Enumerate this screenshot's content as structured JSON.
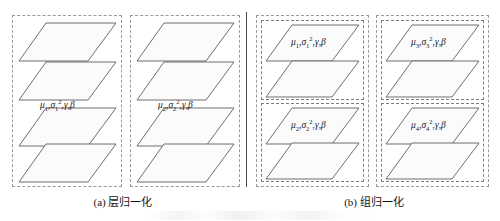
{
  "figure": {
    "background": "#ffffff",
    "stroke_color": "#5f5f5f",
    "dash_color": "#8a8a8a",
    "face_color": "#fbfbfb",
    "divider_color": "#4a4a4a"
  },
  "panels": [
    {
      "id": "a",
      "caption": "(a) 层归一化",
      "groups": [
        {
          "id": "a-group-1",
          "label_mu": "μ",
          "label_mu_sub": "1",
          "label_sigma": "σ",
          "label_sigma_sub": "1",
          "label_sigma_sup": "2",
          "label_gamma": "γ",
          "label_beta": "β",
          "label_full": "μ₁,σ₁²,γ,β",
          "plane_count": 4
        },
        {
          "id": "a-group-2",
          "label_mu": "μ",
          "label_mu_sub": "2",
          "label_sigma": "σ",
          "label_sigma_sub": "2",
          "label_sigma_sup": "2",
          "label_gamma": "γ",
          "label_beta": "β",
          "label_full": "μ₂,σ₂²,γ,β",
          "plane_count": 4
        }
      ]
    },
    {
      "id": "b",
      "caption": "(b) 组归一化",
      "groups": [
        {
          "id": "b-group-1",
          "label_mu": "μ",
          "label_mu_sub": "1",
          "label_sigma": "σ",
          "label_sigma_sub": "1",
          "label_sigma_sup": "2",
          "label_gamma": "γ",
          "label_beta": "β",
          "label_full": "μ₁,σ₁²,γ,β",
          "plane_count": 2
        },
        {
          "id": "b-group-2",
          "label_mu": "μ",
          "label_mu_sub": "2",
          "label_sigma": "σ",
          "label_sigma_sub": "2",
          "label_sigma_sup": "2",
          "label_gamma": "γ",
          "label_beta": "β",
          "label_full": "μ₂,σ₂²,γ,β",
          "plane_count": 2
        },
        {
          "id": "b-group-3",
          "label_mu": "μ",
          "label_mu_sub": "3",
          "label_sigma": "σ",
          "label_sigma_sub": "3",
          "label_sigma_sup": "2",
          "label_gamma": "γ",
          "label_beta": "β",
          "label_full": "μ₃,σ₃²,γ,β",
          "plane_count": 2
        },
        {
          "id": "b-group-4",
          "label_mu": "μ",
          "label_mu_sub": "4",
          "label_sigma": "σ",
          "label_sigma_sub": "4",
          "label_sigma_sup": "2",
          "label_gamma": "γ",
          "label_beta": "β",
          "label_full": "μ₄,σ₄²,γ,β",
          "plane_count": 2
        }
      ]
    }
  ]
}
